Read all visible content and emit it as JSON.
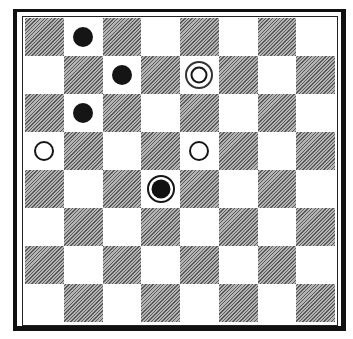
{
  "board": {
    "rows": 8,
    "cols": 8,
    "top_left_square": "dark",
    "colors": {
      "dark": "#8e8e8e",
      "light": "#ffffff",
      "frame": "#111111",
      "piece_black": "#151515"
    },
    "pieces": [
      {
        "row": 0,
        "col": 1,
        "type": "black"
      },
      {
        "row": 1,
        "col": 2,
        "type": "black"
      },
      {
        "row": 1,
        "col": 4,
        "type": "white-king"
      },
      {
        "row": 2,
        "col": 1,
        "type": "black"
      },
      {
        "row": 3,
        "col": 0,
        "type": "white"
      },
      {
        "row": 3,
        "col": 4,
        "type": "white"
      },
      {
        "row": 4,
        "col": 3,
        "type": "black-king"
      }
    ]
  }
}
